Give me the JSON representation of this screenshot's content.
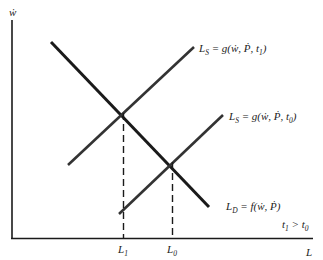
{
  "diagram": {
    "y_axis_label": "ẇ",
    "x_axis_label": "L",
    "curves": [
      {
        "id": "supply_t1",
        "label_main": "L",
        "label_sub": "S",
        "label_rest": " = g(ẇ, Ṗ, t",
        "label_tsub": "1",
        "label_end": ")"
      },
      {
        "id": "supply_t0",
        "label_main": "L",
        "label_sub": "S",
        "label_rest": " = g(ẇ, Ṗ, t",
        "label_tsub": "0",
        "label_end": ")"
      },
      {
        "id": "demand",
        "label_main": "L",
        "label_sub": "D",
        "label_rest": " = f(ẇ, Ṗ)"
      }
    ],
    "tick_labels": [
      {
        "main": "L",
        "sub": "1"
      },
      {
        "main": "L",
        "sub": "0"
      }
    ],
    "note": {
      "a": "t",
      "a_sub": "1",
      "op": " > ",
      "b": "t",
      "b_sub": "0"
    },
    "colors": {
      "line": "#1a1a1a",
      "background": "#ffffff"
    }
  }
}
